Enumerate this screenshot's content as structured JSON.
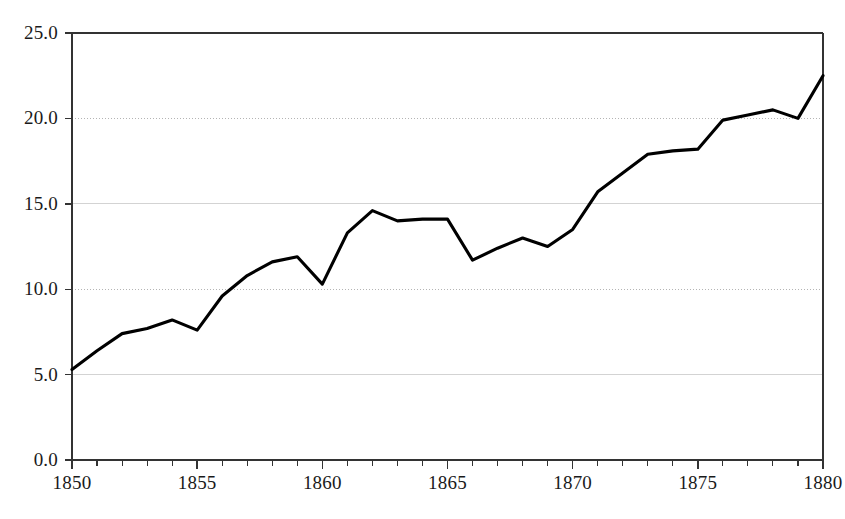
{
  "chart_data": {
    "type": "line",
    "title": "",
    "subtitle": "",
    "xlabel": "",
    "ylabel": "",
    "xlim": [
      1850,
      1880
    ],
    "ylim": [
      0.0,
      25.0
    ],
    "grid": true,
    "legend": null,
    "x": [
      1850,
      1851,
      1852,
      1853,
      1854,
      1855,
      1856,
      1857,
      1858,
      1859,
      1860,
      1861,
      1862,
      1863,
      1864,
      1865,
      1866,
      1867,
      1868,
      1869,
      1870,
      1871,
      1872,
      1873,
      1874,
      1875,
      1876,
      1877,
      1878,
      1879,
      1880
    ],
    "values": [
      5.3,
      6.4,
      7.4,
      7.7,
      8.2,
      7.6,
      9.6,
      10.8,
      11.6,
      11.9,
      10.3,
      13.3,
      14.6,
      14.0,
      14.1,
      14.1,
      11.7,
      12.4,
      13.0,
      12.5,
      13.5,
      15.7,
      16.8,
      17.9,
      18.1,
      18.2,
      19.9,
      20.2,
      20.5,
      20.0,
      22.5
    ],
    "series": [
      {
        "name": "series-1",
        "color": "#000000",
        "values": [
          5.3,
          6.4,
          7.4,
          7.7,
          8.2,
          7.6,
          9.6,
          10.8,
          11.6,
          11.9,
          10.3,
          13.3,
          14.6,
          14.0,
          14.1,
          14.1,
          11.7,
          12.4,
          13.0,
          12.5,
          13.5,
          15.7,
          16.8,
          17.9,
          18.1,
          18.2,
          19.9,
          20.2,
          20.5,
          20.0,
          22.5
        ]
      }
    ],
    "yticks": [
      0.0,
      5.0,
      10.0,
      15.0,
      20.0,
      25.0
    ],
    "ytick_labels": [
      "0.0",
      "5.0",
      "10.0",
      "15.0",
      "20.0",
      "25.0"
    ],
    "xticks": [
      1850,
      1855,
      1860,
      1865,
      1870,
      1875,
      1880
    ],
    "xtick_labels": [
      "1850",
      "1855",
      "1860",
      "1865",
      "1870",
      "1875",
      "1880"
    ],
    "xminor_step": 1,
    "colors": {
      "line": "#000000",
      "axis": "#333333",
      "grid": "#b0b0b0",
      "background": "#ffffff"
    }
  },
  "caption": {
    "text": ""
  }
}
